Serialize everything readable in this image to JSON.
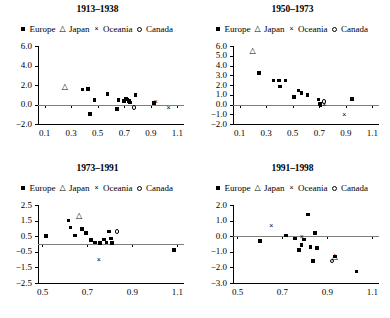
{
  "figure": {
    "legend_labels": [
      "Europe",
      "Japan",
      "Oceania",
      "Canada"
    ],
    "legend_markers": [
      "square",
      "triangle",
      "x",
      "circle"
    ],
    "marker_glyphs": {
      "square": "■",
      "triangle": "△",
      "x": "×",
      "circle": "○"
    },
    "series_colors": {
      "Europe": "#000000",
      "Japan": "#000000",
      "Oceania": "#000000",
      "Canada": "#000000"
    }
  },
  "chart_data": [
    {
      "type": "scatter",
      "title": "1913–1938",
      "xlabel": "",
      "ylabel": "",
      "xlim": [
        0.05,
        1.15
      ],
      "ylim": [
        -2.0,
        6.0
      ],
      "xticks": [
        0.1,
        0.3,
        0.5,
        0.7,
        0.9,
        1.1
      ],
      "xtick_labels": [
        "0.1",
        "0.3",
        "0.5",
        "0.7",
        "0.9",
        "1.1"
      ],
      "yticks": [
        -2.0,
        0.0,
        2.0,
        4.0,
        6.0
      ],
      "ytick_labels": [
        "−2.0",
        "0.0",
        "2.0",
        "4.0",
        "6.0"
      ],
      "grid": false,
      "zero_line": true,
      "legend_position": "above",
      "series": [
        {
          "name": "Europe",
          "marker": "square",
          "points": [
            [
              0.385,
              1.55
            ],
            [
              0.425,
              1.6
            ],
            [
              0.44,
              -1.0
            ],
            [
              0.475,
              0.45
            ],
            [
              0.575,
              1.1
            ],
            [
              0.645,
              -0.45
            ],
            [
              0.655,
              0.45
            ],
            [
              0.7,
              0.35
            ],
            [
              0.715,
              0.6
            ],
            [
              0.725,
              0.5
            ],
            [
              0.735,
              0.35
            ],
            [
              0.745,
              0.2
            ],
            [
              0.785,
              0.95
            ],
            [
              0.925,
              0.15
            ]
          ]
        },
        {
          "name": "Japan",
          "marker": "triangle",
          "points": [
            [
              0.255,
              1.65
            ]
          ]
        },
        {
          "name": "Oceania",
          "marker": "x",
          "points": [
            [
              0.945,
              0.3
            ],
            [
              1.04,
              -0.35
            ]
          ]
        },
        {
          "name": "Canada",
          "marker": "circle",
          "points": [
            [
              0.775,
              -0.3
            ]
          ]
        }
      ]
    },
    {
      "type": "scatter",
      "title": "1950–1973",
      "xlabel": "",
      "ylabel": "",
      "xlim": [
        0.05,
        1.15
      ],
      "ylim": [
        -2.0,
        6.0
      ],
      "xticks": [
        0.1,
        0.3,
        0.5,
        0.7,
        0.9,
        1.1
      ],
      "xtick_labels": [
        "0.1",
        "0.3",
        "0.5",
        "0.7",
        "0.9",
        "1.1"
      ],
      "yticks": [
        -2.0,
        -1.0,
        0.0,
        1.0,
        2.0,
        3.0,
        4.0,
        5.0,
        6.0
      ],
      "ytick_labels": [
        "−2.0",
        "−1.0",
        "0.0",
        "1.0",
        "2.0",
        "3.0",
        "4.0",
        "5.0",
        "6.0"
      ],
      "grid": false,
      "zero_line": true,
      "legend_position": "above",
      "series": [
        {
          "name": "Europe",
          "marker": "square",
          "points": [
            [
              0.245,
              3.25
            ],
            [
              0.355,
              2.45
            ],
            [
              0.395,
              2.45
            ],
            [
              0.405,
              1.85
            ],
            [
              0.445,
              2.45
            ],
            [
              0.51,
              0.75
            ],
            [
              0.545,
              1.45
            ],
            [
              0.565,
              1.2
            ],
            [
              0.61,
              1.0
            ],
            [
              0.695,
              0.5
            ],
            [
              0.705,
              0.05
            ],
            [
              0.71,
              -0.1
            ],
            [
              0.945,
              0.55
            ]
          ]
        },
        {
          "name": "Japan",
          "marker": "triangle",
          "points": [
            [
              0.2,
              5.4
            ]
          ]
        },
        {
          "name": "Oceania",
          "marker": "x",
          "points": [
            [
              0.745,
              -0.05
            ],
            [
              0.895,
              -1.1
            ]
          ]
        },
        {
          "name": "Canada",
          "marker": "circle",
          "points": [
            [
              0.735,
              0.3
            ]
          ]
        }
      ]
    },
    {
      "type": "scatter",
      "title": "1973–1991",
      "xlabel": "",
      "ylabel": "",
      "xlim": [
        0.48,
        1.13
      ],
      "ylim": [
        -2.5,
        2.5
      ],
      "xticks": [
        0.5,
        0.7,
        0.9,
        1.1
      ],
      "xtick_labels": [
        "0.5",
        "0.7",
        "0.9",
        "1.1"
      ],
      "yticks": [
        -2.5,
        -1.5,
        -0.5,
        0.5,
        1.5,
        2.5
      ],
      "ytick_labels": [
        "−2.5",
        "−1.5",
        "−0.5",
        "0.5",
        "1.5",
        "2.5"
      ],
      "grid": false,
      "zero_line": true,
      "legend_position": "above",
      "series": [
        {
          "name": "Europe",
          "marker": "square",
          "points": [
            [
              0.515,
              0.5
            ],
            [
              0.615,
              1.5
            ],
            [
              0.625,
              1.05
            ],
            [
              0.645,
              0.55
            ],
            [
              0.675,
              0.95
            ],
            [
              0.695,
              0.7
            ],
            [
              0.715,
              0.25
            ],
            [
              0.735,
              0.1
            ],
            [
              0.755,
              0.05
            ],
            [
              0.775,
              0.3
            ],
            [
              0.785,
              0.1
            ],
            [
              0.795,
              0.8
            ],
            [
              0.805,
              0.35
            ],
            [
              0.81,
              0.05
            ],
            [
              1.085,
              -0.4
            ]
          ]
        },
        {
          "name": "Japan",
          "marker": "triangle",
          "points": [
            [
              0.665,
              1.7
            ]
          ]
        },
        {
          "name": "Oceania",
          "marker": "x",
          "points": [
            [
              0.755,
              -1.0
            ]
          ]
        },
        {
          "name": "Canada",
          "marker": "circle",
          "points": [
            [
              0.83,
              0.8
            ]
          ]
        }
      ]
    },
    {
      "type": "scatter",
      "title": "1991–1998",
      "xlabel": "",
      "ylabel": "",
      "xlim": [
        0.48,
        1.13
      ],
      "ylim": [
        -3.0,
        2.0
      ],
      "xticks": [
        0.5,
        0.7,
        0.9,
        1.1
      ],
      "xtick_labels": [
        "0.5",
        "0.7",
        "0.9",
        "1.1"
      ],
      "yticks": [
        -3.0,
        -2.0,
        -1.0,
        0.0,
        1.0,
        2.0
      ],
      "ytick_labels": [
        "−3.0",
        "−2.0",
        "−1.0",
        "0.0",
        "1.0",
        "2.0"
      ],
      "grid": false,
      "zero_line": true,
      "legend_position": "above",
      "series": [
        {
          "name": "Europe",
          "marker": "square",
          "points": [
            [
              0.6,
              -0.3
            ],
            [
              0.715,
              0.05
            ],
            [
              0.755,
              -0.15
            ],
            [
              0.775,
              -0.9
            ],
            [
              0.785,
              -0.55
            ],
            [
              0.795,
              -0.2
            ],
            [
              0.815,
              1.4
            ],
            [
              0.825,
              -0.7
            ],
            [
              0.825,
              -0.65
            ],
            [
              0.835,
              -1.6
            ],
            [
              0.845,
              0.2
            ],
            [
              0.855,
              -0.75
            ],
            [
              0.935,
              -1.3
            ],
            [
              1.03,
              -2.25
            ]
          ]
        },
        {
          "name": "Japan",
          "marker": "triangle",
          "points": [
            [
              0.935,
              -1.4
            ]
          ]
        },
        {
          "name": "Oceania",
          "marker": "x",
          "points": [
            [
              0.655,
              0.65
            ],
            [
              0.79,
              -0.05
            ]
          ]
        },
        {
          "name": "Canada",
          "marker": "circle",
          "points": [
            [
              0.92,
              -1.6
            ]
          ]
        }
      ]
    }
  ]
}
